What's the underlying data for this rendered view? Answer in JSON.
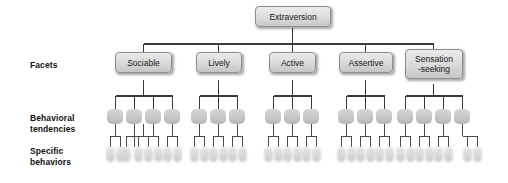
{
  "diagram": {
    "title": "Extraversion",
    "type": "hierarchical-tree",
    "levels": [
      {
        "key": "trait",
        "label": ""
      },
      {
        "key": "facets",
        "label": "Facets"
      },
      {
        "key": "behaviors",
        "label": "Behavioral\ntendencies"
      },
      {
        "key": "specific",
        "label": "Specific\nbehaviors"
      }
    ],
    "root": {
      "label": "Extraversion"
    },
    "facets": [
      {
        "label": "Sociable",
        "tendency_count": 4,
        "behaviors_per_tendency": 2
      },
      {
        "label": "Lively",
        "tendency_count": 3,
        "behaviors_per_tendency": 2
      },
      {
        "label": "Active",
        "tendency_count": 3,
        "behaviors_per_tendency": 2
      },
      {
        "label": "Assertive",
        "tendency_count": 3,
        "behaviors_per_tendency": 2
      },
      {
        "label": "Sensation\n-seeking",
        "tendency_count": 4,
        "behaviors_per_tendency": 2
      }
    ],
    "colors": {
      "background": "#ffffff",
      "node_fill_top": "#e8e8e8",
      "node_fill_bottom": "#c9c9c9",
      "node_border": "#8e8e8e",
      "connector": "#3a3a3a",
      "text": "#1a1a1a"
    }
  }
}
